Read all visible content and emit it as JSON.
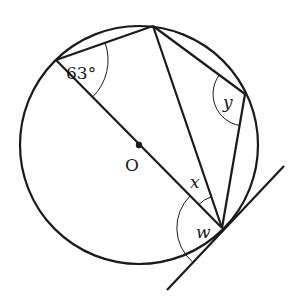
{
  "diagram": {
    "type": "circle-theorem",
    "circle": {
      "cx": 139,
      "cy": 145,
      "r": 119
    },
    "center": {
      "label": "O",
      "x": 139,
      "y": 145
    },
    "points": {
      "A": {
        "x": 56,
        "y": 60
      },
      "B": {
        "x": 153,
        "y": 26
      },
      "C": {
        "x": 245,
        "y": 94
      },
      "D": {
        "x": 222,
        "y": 228
      }
    },
    "tangent": {
      "x1": 167,
      "y1": 290,
      "x2": 284,
      "y2": 166
    },
    "angles": [
      {
        "id": "angle-63",
        "label": "63°",
        "vertex": "A",
        "italic": false
      },
      {
        "id": "angle-y",
        "label": "y",
        "vertex": "C",
        "italic": true
      },
      {
        "id": "angle-x",
        "label": "x",
        "vertex": "D",
        "italic": true
      },
      {
        "id": "angle-w",
        "label": "w",
        "vertex": "D",
        "italic": true
      }
    ],
    "labels": {
      "center": "O",
      "angle_63": "63°",
      "angle_y": "y",
      "angle_x": "x",
      "angle_w": "w"
    },
    "colors": {
      "ink": "#1a1a1a",
      "background": "#ffffff"
    }
  }
}
